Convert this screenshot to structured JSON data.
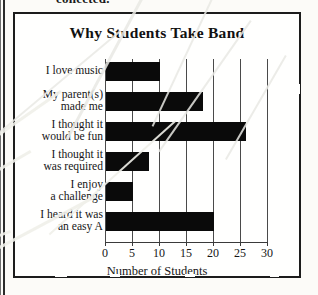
{
  "page": {
    "caption_fragment": "collected.",
    "spine_color": "#2b2b2b"
  },
  "chart_data": {
    "type": "bar",
    "orientation": "horizontal",
    "title": "Why Students Take Band",
    "xlabel": "Number of Students",
    "ylabel": "",
    "categories": [
      "I love music",
      "My parent(s) made me",
      "I thought it would be fun",
      "I thought it was required",
      "I enjoy a challenge",
      "I heard it was an easy A"
    ],
    "values": [
      10,
      18,
      26,
      8,
      5,
      20
    ],
    "xticks": [
      "0",
      "5",
      "10",
      "15",
      "20",
      "25",
      "30"
    ],
    "xlim": [
      0,
      30
    ],
    "grid": true,
    "grid_axis": "x",
    "legend": "none",
    "bar_color": "#0a0a0a"
  },
  "labels": {
    "row0_line1": "I love music",
    "row0_line2": "",
    "row1_line1": "My parent(s)",
    "row1_line2": "made me",
    "row2_line1": "I thought it",
    "row2_line2": "would be fun",
    "row3_line1": "I thought it",
    "row3_line2": "was required",
    "row4_line1": "I enjoy",
    "row4_line2": "a challenge",
    "row5_line1": "I heard it was",
    "row5_line2": "an easy A"
  },
  "ticks": {
    "t0": "0",
    "t1": "5",
    "t2": "10",
    "t3": "15",
    "t4": "20",
    "t5": "25",
    "t6": "30"
  }
}
